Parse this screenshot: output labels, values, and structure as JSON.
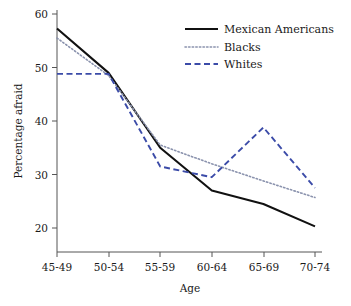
{
  "chart_data": {
    "type": "line",
    "title": "",
    "xlabel": "Age",
    "ylabel": "Percentage afraid",
    "categories": [
      "45-49",
      "50-54",
      "55-59",
      "60-64",
      "65-69",
      "70-74"
    ],
    "ylim": [
      15,
      60
    ],
    "xlim": [
      0,
      5
    ],
    "yticks": [
      20,
      30,
      40,
      50,
      60
    ],
    "ytick_labels": [
      "20",
      "30",
      "40",
      "50",
      "60"
    ],
    "grid": false,
    "legend_position": "top-right",
    "series": [
      {
        "name": "Mexican Americans",
        "style": "solid",
        "color": "#111111",
        "values": [
          57.3,
          49.0,
          35.0,
          27.0,
          24.5,
          20.3
        ]
      },
      {
        "name": "Blacks",
        "style": "dotted",
        "color": "#8a92ad",
        "values": [
          55.5,
          48.5,
          35.5,
          32.0,
          28.8,
          25.7
        ]
      },
      {
        "name": "Whites",
        "style": "dashed",
        "color": "#3b4ba8",
        "values": [
          48.8,
          48.8,
          31.5,
          29.5,
          38.8,
          27.5
        ]
      }
    ]
  },
  "axes": {
    "y_title": "Percentage afraid",
    "x_title": "Age"
  },
  "legend": {
    "items": [
      {
        "label": "Mexican Americans"
      },
      {
        "label": "Blacks"
      },
      {
        "label": "Whites"
      }
    ]
  },
  "ticks": {
    "y": [
      "60",
      "50",
      "40",
      "30",
      "20"
    ],
    "x": [
      "45-49",
      "50-54",
      "55-59",
      "60-64",
      "65-69",
      "70-74"
    ]
  }
}
